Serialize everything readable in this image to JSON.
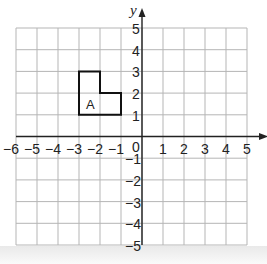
{
  "diagram": {
    "type": "coordinate-grid",
    "x_axis": {
      "label": "x",
      "min": -6,
      "max": 5,
      "tick_labels": [
        "-6",
        "-5",
        "-4",
        "-3",
        "-2",
        "-1",
        "0",
        "1",
        "2",
        "3",
        "4",
        "5"
      ]
    },
    "y_axis": {
      "label": "y",
      "min": -5,
      "max": 5,
      "tick_labels": [
        "5",
        "4",
        "3",
        "2",
        "1",
        "-1",
        "-2",
        "-3",
        "-4",
        "-5"
      ]
    },
    "origin_label": "0",
    "shapes": [
      {
        "name": "A",
        "label": "A",
        "vertices": [
          [
            -3,
            1
          ],
          [
            -3,
            3
          ],
          [
            -2,
            3
          ],
          [
            -2,
            2
          ],
          [
            -1,
            2
          ],
          [
            -1,
            1
          ]
        ]
      }
    ],
    "colors": {
      "grid": "#b5b5b5",
      "axis": "#222222",
      "shape": "#111111"
    }
  }
}
